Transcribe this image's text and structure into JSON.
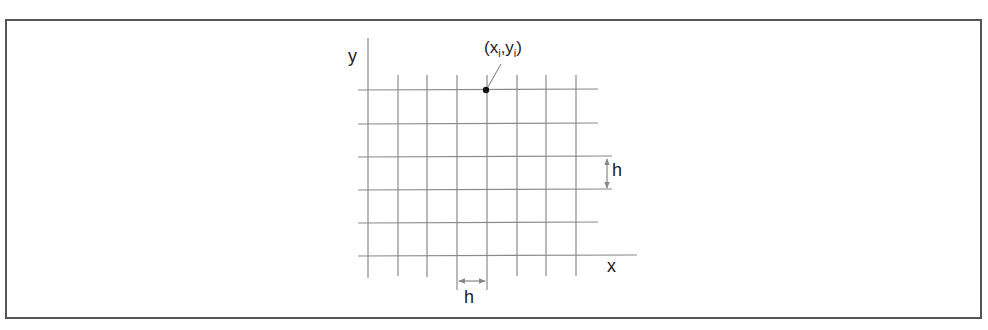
{
  "diagram": {
    "axis_labels": {
      "x": "x",
      "y": "y"
    },
    "point_label": {
      "base_x": "(x",
      "sub_x": "i",
      "comma": ",",
      "base_y": "y",
      "sub_y": "i",
      "close": ")"
    },
    "spacing_label_vertical": "h",
    "spacing_label_horizontal": "h",
    "grid": {
      "vertical_lines_x": [
        368,
        398,
        427,
        457,
        487,
        517,
        546,
        576
      ],
      "horizontal_lines_y": [
        90,
        124,
        157,
        190,
        223,
        256
      ]
    },
    "colors": {
      "grid_line": "#8a8a8a",
      "frame": "#555555",
      "point": "#111111",
      "arrow": "#888888",
      "text": "#222222"
    }
  }
}
